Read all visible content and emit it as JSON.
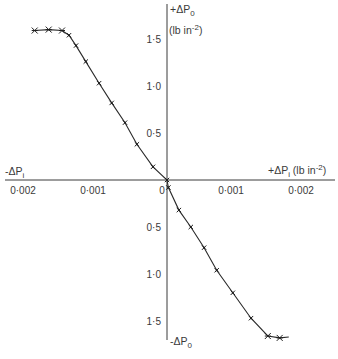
{
  "chart_data": {
    "type": "line",
    "title": "",
    "x_axis": {
      "positive_label": {
        "main": "+ΔP",
        "sub": "i",
        "units_open": " (lb in",
        "units_sup": "-2",
        "units_close": ")"
      },
      "negative_label": {
        "main": "-ΔP",
        "sub": "i"
      },
      "range": [
        -0.00231,
        0.0024
      ],
      "ticks": [
        {
          "value": -0.002,
          "label": "0·002"
        },
        {
          "value": -0.001,
          "label": "0·001"
        },
        {
          "value": 0,
          "label": "0"
        },
        {
          "value": 0.001,
          "label": "0·001"
        },
        {
          "value": 0.002,
          "label": "0·002"
        }
      ]
    },
    "y_axis": {
      "positive_label": {
        "main": "+ΔP",
        "sub": "0"
      },
      "units_label": {
        "open": "(lb in",
        "sup": "-2",
        "close": ")"
      },
      "negative_label": {
        "main": "-ΔP",
        "sub": "0"
      },
      "range": [
        -1.7,
        1.87
      ],
      "ticks": [
        {
          "value": 1.5,
          "label": "1·5"
        },
        {
          "value": 1.0,
          "label": "1·0"
        },
        {
          "value": 0.5,
          "label": "0·5"
        },
        {
          "value": -0.5,
          "label": "0·5"
        },
        {
          "value": -1.0,
          "label": "1·0"
        },
        {
          "value": -1.5,
          "label": "1·5"
        }
      ]
    },
    "grid": false,
    "legend": "none",
    "series": [
      {
        "name": "ΔP0 vs ΔPi",
        "points": [
          {
            "x": -0.00189,
            "y": 1.59,
            "marker": "star"
          },
          {
            "x": -0.00169,
            "y": 1.6,
            "marker": "star"
          },
          {
            "x": -0.0015,
            "y": 1.59,
            "marker": "star"
          },
          {
            "x": -0.0014,
            "y": 1.54,
            "marker": "tick"
          },
          {
            "x": -0.0013,
            "y": 1.43,
            "marker": "tick"
          },
          {
            "x": -0.00116,
            "y": 1.26,
            "marker": "tick"
          },
          {
            "x": -0.00097,
            "y": 1.03,
            "marker": "tick"
          },
          {
            "x": -0.00079,
            "y": 0.82,
            "marker": "tick"
          },
          {
            "x": -0.0006,
            "y": 0.61,
            "marker": "tick"
          },
          {
            "x": -0.00043,
            "y": 0.38,
            "marker": "tick"
          },
          {
            "x": -0.0002,
            "y": 0.14,
            "marker": "tick"
          },
          {
            "x": 0.0,
            "y": 0.0,
            "marker": "tick"
          },
          {
            "x": 2e-05,
            "y": -0.08,
            "marker": "tick"
          },
          {
            "x": 0.00017,
            "y": -0.32,
            "marker": "tick"
          },
          {
            "x": 0.00034,
            "y": -0.5,
            "marker": "tick"
          },
          {
            "x": 0.00053,
            "y": -0.72,
            "marker": "tick"
          },
          {
            "x": 0.00071,
            "y": -0.96,
            "marker": "tick"
          },
          {
            "x": 0.00094,
            "y": -1.2,
            "marker": "tick"
          },
          {
            "x": 0.0012,
            "y": -1.47,
            "marker": "tick"
          },
          {
            "x": 0.00144,
            "y": -1.66,
            "marker": "star"
          },
          {
            "x": 0.00161,
            "y": -1.68,
            "marker": "star"
          },
          {
            "x": 0.00174,
            "y": -1.67,
            "marker": "none"
          }
        ]
      }
    ]
  }
}
